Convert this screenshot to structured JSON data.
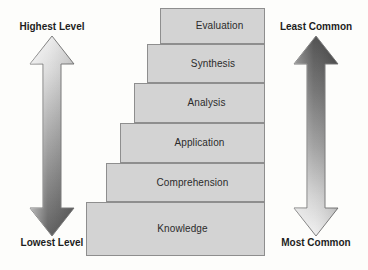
{
  "diagram": {
    "background_color": "#fdfdfb",
    "step_fill_color": "#d3d3d3",
    "step_border_color": "#8e8e8e",
    "text_color": "#2b2b2b"
  },
  "steps": [
    {
      "label": "Evaluation",
      "rank": 6,
      "x": 160,
      "y": 8,
      "width": 105,
      "height": 36
    },
    {
      "label": "Synthesis",
      "rank": 5,
      "x": 147,
      "y": 44,
      "width": 118,
      "height": 39
    },
    {
      "label": "Analysis",
      "rank": 4,
      "x": 134,
      "y": 83,
      "width": 131,
      "height": 40
    },
    {
      "label": "Application",
      "rank": 3,
      "x": 120,
      "y": 123,
      "width": 145,
      "height": 40
    },
    {
      "label": "Comprehension",
      "rank": 2,
      "x": 106,
      "y": 163,
      "width": 159,
      "height": 39
    },
    {
      "label": "Knowledge",
      "rank": 1,
      "x": 86,
      "y": 202,
      "width": 179,
      "height": 54
    }
  ],
  "left_arrow": {
    "name": "level-arrow",
    "top_label": "Highest Level",
    "bottom_label": "Lowest Level",
    "direction": "double-headed-vertical",
    "gradient_top_color": "#eaeaea",
    "gradient_bottom_color": "#565656",
    "outline_color": "#7a7a7a"
  },
  "right_arrow": {
    "name": "frequency-arrow",
    "top_label": "Least Common",
    "bottom_label": "Most Common",
    "direction": "double-headed-vertical",
    "gradient_top_color": "#4a4a4a",
    "gradient_bottom_color": "#eeeeee",
    "outline_color": "#7a7a7a"
  }
}
